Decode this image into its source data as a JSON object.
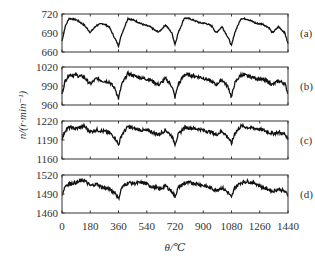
{
  "chart_data": {
    "type": "line",
    "xlabel": "θ/℃",
    "ylabel": "n/(r·min⁻¹)",
    "x_ticks": [
      0,
      180,
      360,
      540,
      720,
      900,
      1080,
      1260,
      1440
    ],
    "xlim": [
      0,
      1440
    ],
    "grid": false,
    "panels": [
      {
        "label": "(a)",
        "ylim": [
          660,
          720
        ],
        "y_ticks": [
          660,
          690,
          720
        ],
        "x": [
          0,
          20,
          45,
          90,
          140,
          180,
          220,
          260,
          300,
          340,
          360,
          380,
          420,
          460,
          520,
          560,
          600,
          620,
          660,
          700,
          720,
          740,
          780,
          820,
          880,
          920,
          960,
          980,
          1020,
          1060,
          1080,
          1100,
          1140,
          1180,
          1240,
          1280,
          1320,
          1340,
          1380,
          1420,
          1440
        ],
        "y": [
          677,
          700,
          713,
          711,
          703,
          691,
          702,
          705,
          700,
          680,
          670,
          688,
          713,
          710,
          703,
          700,
          693,
          692,
          703,
          690,
          672,
          690,
          714,
          712,
          706,
          705,
          700,
          690,
          700,
          682,
          670,
          690,
          713,
          712,
          705,
          704,
          698,
          690,
          700,
          690,
          673
        ]
      },
      {
        "label": "(b)",
        "ylim": [
          960,
          1020
        ],
        "y_ticks": [
          960,
          990,
          1020
        ],
        "x": [
          0,
          20,
          45,
          90,
          140,
          180,
          220,
          260,
          300,
          340,
          360,
          380,
          420,
          460,
          520,
          560,
          600,
          620,
          660,
          700,
          720,
          740,
          780,
          820,
          880,
          920,
          960,
          980,
          1020,
          1060,
          1080,
          1100,
          1140,
          1180,
          1240,
          1280,
          1320,
          1340,
          1380,
          1420,
          1440
        ],
        "y": [
          978,
          998,
          1008,
          1007,
          1004,
          993,
          1002,
          998,
          997,
          985,
          970,
          992,
          1010,
          1006,
          1002,
          1000,
          994,
          992,
          1002,
          990,
          972,
          992,
          1008,
          1007,
          1004,
          1001,
          996,
          992,
          1000,
          988,
          972,
          994,
          1008,
          1006,
          1002,
          1000,
          996,
          992,
          998,
          994,
          978
        ]
      },
      {
        "label": "(c)",
        "ylim": [
          1160,
          1220
        ],
        "y_ticks": [
          1160,
          1190,
          1220
        ],
        "x": [
          0,
          20,
          45,
          90,
          140,
          180,
          220,
          260,
          300,
          340,
          360,
          380,
          420,
          460,
          520,
          560,
          600,
          620,
          660,
          700,
          720,
          740,
          780,
          820,
          880,
          920,
          960,
          980,
          1020,
          1060,
          1080,
          1100,
          1140,
          1180,
          1240,
          1280,
          1320,
          1340,
          1380,
          1420,
          1440
        ],
        "y": [
          1192,
          1205,
          1210,
          1208,
          1212,
          1203,
          1206,
          1204,
          1202,
          1193,
          1182,
          1198,
          1211,
          1208,
          1205,
          1204,
          1200,
          1199,
          1206,
          1196,
          1184,
          1198,
          1210,
          1209,
          1207,
          1204,
          1202,
          1198,
          1204,
          1194,
          1184,
          1200,
          1212,
          1210,
          1208,
          1206,
          1202,
          1200,
          1202,
          1199,
          1192
        ]
      },
      {
        "label": "(d)",
        "ylim": [
          1460,
          1520
        ],
        "y_ticks": [
          1460,
          1490,
          1520
        ],
        "x": [
          0,
          20,
          45,
          90,
          140,
          180,
          220,
          260,
          300,
          340,
          360,
          380,
          420,
          460,
          520,
          560,
          600,
          620,
          660,
          700,
          720,
          740,
          780,
          820,
          880,
          920,
          960,
          980,
          1020,
          1060,
          1080,
          1100,
          1140,
          1180,
          1240,
          1280,
          1320,
          1340,
          1380,
          1420,
          1440
        ],
        "y": [
          1488,
          1503,
          1506,
          1508,
          1512,
          1503,
          1506,
          1500,
          1498,
          1492,
          1482,
          1500,
          1508,
          1507,
          1508,
          1503,
          1500,
          1497,
          1503,
          1494,
          1486,
          1500,
          1507,
          1508,
          1505,
          1502,
          1498,
          1496,
          1500,
          1492,
          1484,
          1500,
          1508,
          1510,
          1506,
          1500,
          1497,
          1494,
          1498,
          1494,
          1488
        ]
      }
    ]
  }
}
